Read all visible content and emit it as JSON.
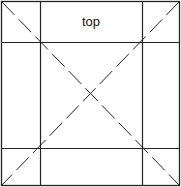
{
  "diagram": {
    "top_label": "top",
    "line_color": "#222222",
    "outer": {
      "x": 2,
      "y": 2,
      "w": 177,
      "h": 183
    },
    "inner_x": [
      40,
      142
    ],
    "inner_y": [
      42,
      148
    ]
  }
}
